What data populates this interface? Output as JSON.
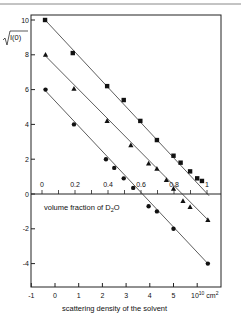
{
  "chart_data": {
    "type": "scatter",
    "title": "",
    "ylabel": "√I(0)",
    "xlabel": "scattering density of the solvent",
    "x_unit": "10^10 cm^2",
    "secondary_xlabel": "volume fraction of D2O",
    "xlim": [
      -1,
      6.5
    ],
    "ylim": [
      -5.4,
      10.4
    ],
    "secondary_xlim": [
      0,
      1
    ],
    "grid": false,
    "legend": null,
    "x_ticks": [
      -1,
      0,
      1,
      2,
      3,
      4,
      5
    ],
    "x_tick_labels": [
      "-1",
      "0",
      "1",
      "2",
      "3",
      "4",
      "5",
      "10",
      "cm²"
    ],
    "y_ticks": [
      10,
      8,
      6,
      4,
      2,
      0,
      -2,
      -4
    ],
    "y_tick_labels": [
      "10",
      "8",
      "6",
      "4",
      "2",
      "0",
      "-2",
      "-4"
    ],
    "secondary_x_ticks": [
      0,
      0.2,
      0.4,
      0.6,
      0.8,
      1
    ],
    "secondary_x_tick_labels": [
      "0",
      "0.2",
      "0.4",
      "0.6",
      "0.8",
      "1"
    ],
    "series": [
      {
        "name": "squares",
        "marker": "square",
        "x": [
          -0.42,
          0.75,
          2.2,
          2.9,
          3.6,
          4.3,
          5.0,
          5.3,
          5.7,
          6.0,
          6.2
        ],
        "y": [
          10.0,
          8.1,
          6.2,
          5.4,
          4.2,
          3.1,
          2.2,
          1.8,
          1.3,
          0.9,
          0.75
        ],
        "fit_line": {
          "x": [
            -0.45,
            6.5
          ],
          "y": [
            10.05,
            -0.1
          ]
        }
      },
      {
        "name": "triangles",
        "marker": "triangle",
        "x": [
          -0.4,
          0.8,
          2.2,
          3.2,
          3.95,
          4.3,
          4.7,
          5.0,
          5.4,
          5.7,
          6.45
        ],
        "y": [
          8.0,
          6.05,
          4.2,
          2.8,
          1.75,
          1.45,
          0.8,
          0.3,
          -0.4,
          -0.75,
          -1.5
        ],
        "fit_line": {
          "x": [
            -0.45,
            6.5
          ],
          "y": [
            8.0,
            -1.55
          ]
        }
      },
      {
        "name": "circles",
        "marker": "circle",
        "x": [
          -0.4,
          0.8,
          2.15,
          2.5,
          2.9,
          3.3,
          3.95,
          4.3,
          5.0,
          6.45
        ],
        "y": [
          6.0,
          4.0,
          2.0,
          1.5,
          0.9,
          0.35,
          -0.7,
          -1.0,
          -2.0,
          -4.0
        ],
        "fit_line": {
          "x": [
            -0.45,
            6.45
          ],
          "y": [
            6.0,
            -4.0
          ]
        }
      }
    ]
  },
  "labels": {
    "ylabel": "√I(0)",
    "xlabel": "scattering density of the solvent",
    "x_unit_base": "10",
    "x_unit_exp": "10",
    "x_unit_rest": "cm",
    "x_unit_sq": "2",
    "secondary_xlabel_main": "volume fraction of D",
    "secondary_xlabel_sub": "2",
    "secondary_xlabel_end": "O"
  }
}
